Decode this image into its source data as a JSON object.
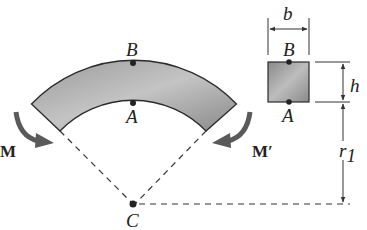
{
  "diagram": {
    "colors": {
      "section_fill": "#8f8f8f",
      "section_fill_light": "#c8c8c8",
      "stroke": "#2a2a2a",
      "arrow": "#5a5a5a",
      "dashed": "#333333"
    },
    "labels": {
      "B_curved": "B",
      "A_curved": "A",
      "C": "C",
      "M": "M",
      "M_prime": "M′",
      "b": "b",
      "B_section": "B",
      "A_section": "A",
      "h": "h",
      "r": "r",
      "r_sub": "1"
    }
  }
}
